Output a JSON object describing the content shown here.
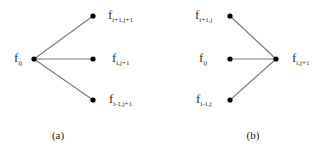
{
  "diagram": {
    "panels": [
      {
        "id": "a",
        "caption": "(a)",
        "description": "one-to-many",
        "nodes": [
          {
            "id": "src",
            "label_main": "f",
            "label_sub": "ij"
          },
          {
            "id": "t1",
            "label_main": "f",
            "label_sub": "i+1,j+1"
          },
          {
            "id": "t2",
            "label_main": "f",
            "label_sub": "i,j+1"
          },
          {
            "id": "t3",
            "label_main": "f",
            "label_sub": "i-1,j+1"
          }
        ],
        "edges": [
          [
            "src",
            "t1"
          ],
          [
            "src",
            "t2"
          ],
          [
            "src",
            "t3"
          ]
        ]
      },
      {
        "id": "b",
        "caption": "(b)",
        "description": "many-to-one",
        "nodes": [
          {
            "id": "s1",
            "label_main": "f",
            "label_sub": "i+1,j"
          },
          {
            "id": "s2",
            "label_main": "f",
            "label_sub": "ij"
          },
          {
            "id": "s3",
            "label_main": "f",
            "label_sub": "i-1,j"
          },
          {
            "id": "dst",
            "label_main": "f",
            "label_sub": "i,j+1"
          }
        ],
        "edges": [
          [
            "s1",
            "dst"
          ],
          [
            "s2",
            "dst"
          ],
          [
            "s3",
            "dst"
          ]
        ]
      }
    ]
  }
}
